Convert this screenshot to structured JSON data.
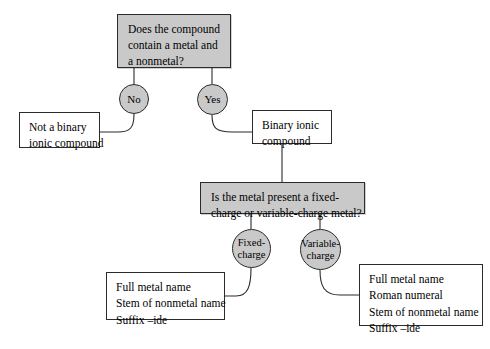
{
  "diagram": {
    "colors": {
      "node_fill_gray": "#c9c9c9",
      "node_fill_white": "#ffffff",
      "stroke": "#2b2b2b",
      "background": "#ffffff"
    }
  },
  "nodes": {
    "question_1": {
      "shape": "rectangle",
      "lines": [
        "Does the compound",
        "contain a metal and",
        "a nonmetal?"
      ]
    },
    "branch_no": {
      "shape": "ellipse",
      "label": "No"
    },
    "branch_yes": {
      "shape": "ellipse",
      "label": "Yes"
    },
    "not_binary": {
      "shape": "rectangle",
      "lines": [
        "Not a binary",
        "ionic compound"
      ]
    },
    "binary_ionic": {
      "shape": "rectangle",
      "lines": [
        "Binary ionic",
        "compound"
      ]
    },
    "question_2": {
      "shape": "rectangle",
      "lines": [
        "Is the metal present a fixed-",
        "charge or variable-charge metal?"
      ]
    },
    "branch_fixed": {
      "shape": "ellipse",
      "lines": [
        "Fixed-",
        "charge"
      ]
    },
    "branch_variable": {
      "shape": "ellipse",
      "lines": [
        "Variable-",
        "charge"
      ]
    },
    "fixed_result": {
      "shape": "rectangle",
      "lines": [
        "Full metal name",
        "Stem of nonmetal name",
        "Suffix –ide"
      ]
    },
    "variable_result": {
      "shape": "rectangle",
      "lines": [
        "Full metal name",
        "Roman numeral",
        "Stem of nonmetal name",
        "Suffix –ide"
      ]
    }
  },
  "edges": [
    {
      "from": "question_1",
      "to": "branch_no",
      "label": "No"
    },
    {
      "from": "question_1",
      "to": "branch_yes",
      "label": "Yes"
    },
    {
      "from": "branch_no",
      "to": "not_binary",
      "label": ""
    },
    {
      "from": "branch_yes",
      "to": "binary_ionic",
      "label": ""
    },
    {
      "from": "binary_ionic",
      "to": "question_2",
      "label": ""
    },
    {
      "from": "question_2",
      "to": "branch_fixed",
      "label": "Fixed-charge"
    },
    {
      "from": "question_2",
      "to": "branch_variable",
      "label": "Variable-charge"
    },
    {
      "from": "branch_fixed",
      "to": "fixed_result",
      "label": ""
    },
    {
      "from": "branch_variable",
      "to": "variable_result",
      "label": ""
    }
  ]
}
